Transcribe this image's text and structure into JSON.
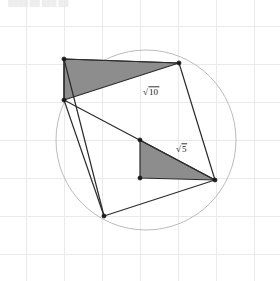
{
  "canvas": {
    "width": 280,
    "height": 281,
    "background": "#ffffff"
  },
  "grid": {
    "visible": true,
    "spacing": 38,
    "origin_x": 26,
    "origin_y": 26,
    "color": "#e9e9ee",
    "line_width": 1
  },
  "circle": {
    "name": "circumcircle",
    "cx": 146,
    "cy": 140,
    "r": 90,
    "stroke": "#bcbcbc",
    "stroke_width": 1,
    "fill": "none"
  },
  "colors": {
    "shade_fill": "#8d8d8d",
    "outline": "#2b2b2b",
    "grid": "#e9e9ee",
    "circle": "#bcbcbc",
    "vertex_dot": "#1a1a1a",
    "label_text": "#1a1a1a"
  },
  "quadrilateral": {
    "name": "inscribed-quadrilateral",
    "points": "64,59 179,63 215,180 104,216",
    "stroke": "#2b2b2b",
    "stroke_width": 1.2,
    "fill": "none"
  },
  "diagonal": {
    "name": "diagonal-segment",
    "x1": 64,
    "y1": 100,
    "x2": 215,
    "y2": 180,
    "stroke": "#2b2b2b",
    "stroke_width": 1.2
  },
  "edge_left_upper": {
    "name": "left-upper-edge",
    "x1": 64,
    "y1": 59,
    "x2": 64,
    "y2": 100,
    "stroke": "#2b2b2b",
    "stroke_width": 1.2
  },
  "edge_left_lower": {
    "name": "left-lower-edge",
    "x1": 64,
    "y1": 100,
    "x2": 104,
    "y2": 216,
    "stroke": "#2b2b2b",
    "stroke_width": 1.2
  },
  "triangles": [
    {
      "id": "triangle-sqrt10",
      "points": "64,59 179,63 64,100",
      "fill": "#8d8d8d",
      "stroke": "#2b2b2b",
      "stroke_width": 1.2,
      "label": "√10",
      "label_symbol": "√",
      "label_radicand": "10",
      "label_x": 143,
      "label_y": 95
    },
    {
      "id": "triangle-sqrt5",
      "points": "140,140 215,180 140,178",
      "fill": "#8d8d8d",
      "stroke": "#2b2b2b",
      "stroke_width": 1.2,
      "label": "√5",
      "label_symbol": "√",
      "label_radicand": "5",
      "label_x": 176,
      "label_y": 152
    }
  ],
  "vertices": [
    {
      "name": "vertex-top-left",
      "cx": 64,
      "cy": 59,
      "r": 2.1
    },
    {
      "name": "vertex-top-right",
      "cx": 179,
      "cy": 63,
      "r": 2.1
    },
    {
      "name": "vertex-left-middle",
      "cx": 64,
      "cy": 100,
      "r": 2.1
    },
    {
      "name": "vertex-right",
      "cx": 215,
      "cy": 180,
      "r": 2.1
    },
    {
      "name": "vertex-bottom",
      "cx": 104,
      "cy": 216,
      "r": 2.1
    },
    {
      "name": "vertex-inner-top",
      "cx": 140,
      "cy": 140,
      "r": 2.1
    },
    {
      "name": "vertex-inner-bottom",
      "cx": 140,
      "cy": 178,
      "r": 2.1
    }
  ],
  "artifact": {
    "text": "████ ██ ███ ██",
    "visible": true
  }
}
